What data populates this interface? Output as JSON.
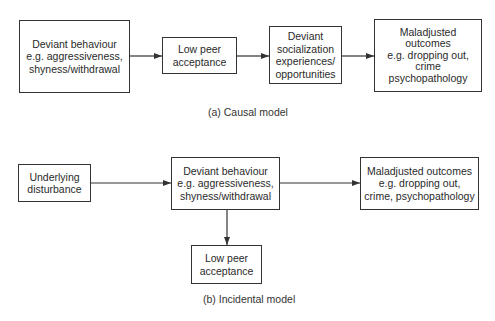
{
  "causal_model": {
    "caption": "(a) Causal model",
    "boxes": [
      {
        "id": "deviant-behaviour",
        "text": "Deviant behaviour\ne.g. aggressiveness,\nshyness/withdrawal"
      },
      {
        "id": "low-peer-acceptance",
        "text": "Low peer\nacceptance"
      },
      {
        "id": "deviant-socialization",
        "text": "Deviant\nsocialization\nexperiences/\nopportunities"
      },
      {
        "id": "maladjusted-outcomes",
        "text": "Maladjusted\noutcomes\ne.g. dropping out,\ncrime\npsychopathology"
      }
    ],
    "edges": [
      {
        "from": "deviant-behaviour",
        "to": "low-peer-acceptance"
      },
      {
        "from": "low-peer-acceptance",
        "to": "deviant-socialization"
      },
      {
        "from": "deviant-socialization",
        "to": "maladjusted-outcomes"
      }
    ]
  },
  "incidental_model": {
    "caption": "(b) Incidental model",
    "boxes": [
      {
        "id": "underlying-disturbance",
        "text": "Underlying\ndisturbance"
      },
      {
        "id": "deviant-behaviour",
        "text": "Deviant behaviour\ne.g. aggressiveness,\nshyness/withdrawal"
      },
      {
        "id": "maladjusted-outcomes",
        "text": "Maladjusted outcomes\ne.g. dropping out,\ncrime, psychopathology"
      },
      {
        "id": "low-peer-acceptance",
        "text": "Low peer\nacceptance"
      }
    ],
    "edges": [
      {
        "from": "underlying-disturbance",
        "to": "deviant-behaviour"
      },
      {
        "from": "deviant-behaviour",
        "to": "maladjusted-outcomes"
      },
      {
        "from": "deviant-behaviour",
        "to": "low-peer-acceptance"
      }
    ]
  }
}
